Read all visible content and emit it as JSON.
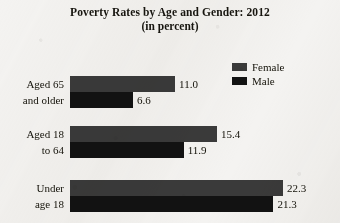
{
  "chart_data": {
    "type": "bar",
    "orientation": "horizontal",
    "title": "Poverty Rates by Age and Gender: 2012",
    "subtitle": "(in percent)",
    "xlabel": "",
    "ylabel": "",
    "categories": [
      "Aged 65 and older",
      "Aged 18 to 64",
      "Under age 18"
    ],
    "category_lines": [
      [
        "Aged 65",
        "and older"
      ],
      [
        "Aged 18",
        "to 64"
      ],
      [
        "Under",
        "age 18"
      ]
    ],
    "series": [
      {
        "name": "Female",
        "values": [
          11.0,
          15.4,
          22.3
        ],
        "color": "#3a3a3a"
      },
      {
        "name": "Male",
        "values": [
          6.6,
          11.9,
          21.3
        ],
        "color": "#121212"
      }
    ],
    "value_labels": [
      [
        "11.0",
        "6.6"
      ],
      [
        "15.4",
        "11.9"
      ],
      [
        "22.3",
        "21.3"
      ]
    ],
    "xlim": [
      0,
      22.3
    ],
    "grid": false,
    "legend_position": "top-right",
    "px_per_unit": 9.55
  },
  "legend": {
    "entries": [
      {
        "label": "Female",
        "color": "#3a3a3a"
      },
      {
        "label": "Male",
        "color": "#121212"
      }
    ]
  },
  "colors": {
    "background": "#f4f3f1",
    "text": "#141209",
    "female_bar": "#3a3a3a",
    "male_bar": "#121212"
  }
}
